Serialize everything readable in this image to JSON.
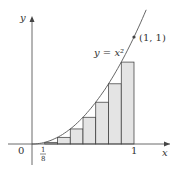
{
  "diagram": {
    "curve_label": "y = x²",
    "point_label": "(1, 1)",
    "x_axis_label": "x",
    "y_axis_label": "y",
    "origin_label": "0",
    "tick_one_label": "1",
    "tick_eighth_num": "1",
    "tick_eighth_den": "8",
    "n_rectangles": 8,
    "rule": "left endpoints",
    "colors": {
      "fill": "#e4e4e4",
      "stroke": "#333333",
      "curve": "#555555"
    }
  }
}
